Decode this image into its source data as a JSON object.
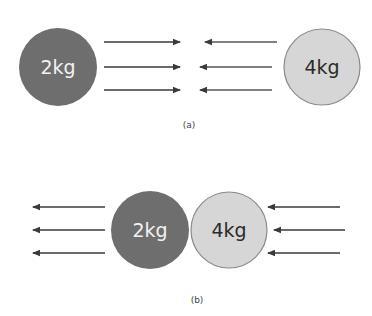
{
  "colors": {
    "mass_small_fill": "#6e6e6e",
    "mass_large_fill": "#d6d6d6",
    "mass_large_stroke": "#8a8a8a",
    "arrow": "#3a3a3a",
    "label_light": "#f2f2f2",
    "label_dark": "#2b2b2b"
  },
  "panels": [
    {
      "caption": "(a)",
      "masses": [
        {
          "label": "2kg"
        },
        {
          "label": "4kg"
        }
      ],
      "description": "Before collision: 2kg moving right, 4kg moving left"
    },
    {
      "caption": "(b)",
      "masses": [
        {
          "label": "2kg"
        },
        {
          "label": "4kg"
        }
      ],
      "description": "During collision: forces pushing 2kg left and 4kg left"
    }
  ]
}
